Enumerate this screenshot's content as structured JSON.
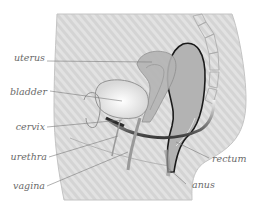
{
  "diagram": {
    "labels": {
      "uterus": "uterus",
      "bladder": "bladder",
      "cervix": "cervix",
      "urethra": "urethra",
      "vagina": "vagina",
      "rectum": "rectum",
      "anus": "anus"
    },
    "colors": {
      "body_fill": "#d6d6d6",
      "stripe": "#e6e6e6",
      "organ_fill": "#b8b8b8",
      "outline": "#8a8a8a",
      "rectum_outline": "#1a1a1a",
      "label_text": "#6a6a6a",
      "leader_line": "#7a7a7a"
    }
  }
}
